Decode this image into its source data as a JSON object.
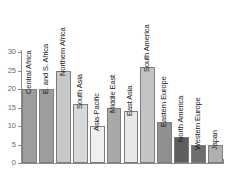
{
  "chart_data": {
    "type": "bar",
    "title": "",
    "subtitle": "",
    "xlabel": "",
    "ylabel": "",
    "ylim": [
      0,
      30
    ],
    "yticks": [
      0,
      5,
      10,
      15,
      20,
      25,
      30
    ],
    "grid": false,
    "legend": null,
    "categories": [
      "Central Africa",
      "E. and S. Africa",
      "Northern Africa",
      "South Asia",
      "Asia-Pacific",
      "Middle East",
      "East Asia",
      "South America",
      "Eastern Europe",
      "North America",
      "Western Europe",
      "Japan"
    ],
    "values": [
      20,
      20,
      25,
      16,
      10,
      15,
      14,
      26,
      11,
      7,
      5,
      5
    ],
    "bar_colors": [
      "#9d9d9d",
      "#9d9d9d",
      "#c8c8c8",
      "#d8d8d8",
      "#efefef",
      "#a8a8a8",
      "#e8e8e8",
      "#c4c4c4",
      "#909090",
      "#5e5e5e",
      "#6e6e6e",
      "#b0b0b0"
    ]
  },
  "axis": {
    "tick_labels": [
      "0",
      "5",
      "10",
      "15",
      "20",
      "25",
      "30"
    ]
  }
}
